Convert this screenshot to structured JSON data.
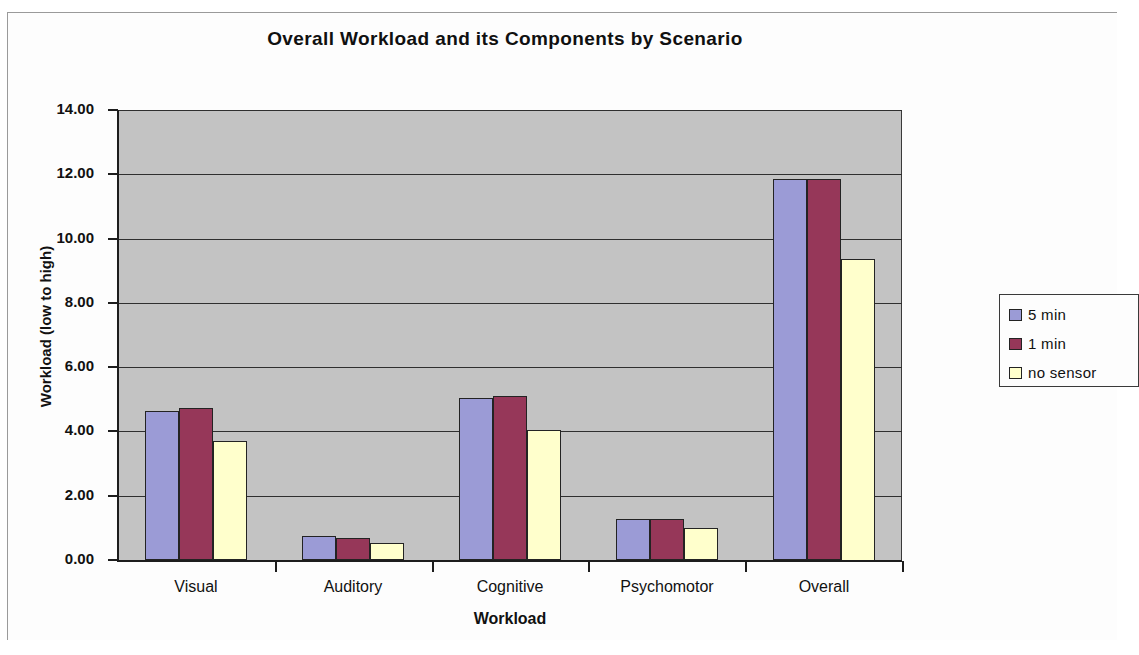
{
  "chart_data": {
    "type": "bar",
    "title": "Overall Workload and its Components by Scenario",
    "xlabel": "Workload",
    "ylabel": "Workload (low to high)",
    "categories": [
      "Visual",
      "Auditory",
      "Cognitive",
      "Psychomotor",
      "Overall"
    ],
    "series": [
      {
        "name": "5 min",
        "color": "#9b9bd6",
        "values": [
          4.65,
          0.75,
          5.05,
          1.28,
          11.85
        ]
      },
      {
        "name": "1 min",
        "color": "#963759",
        "values": [
          4.72,
          0.68,
          5.1,
          1.28,
          11.85
        ]
      },
      {
        "name": "no sensor",
        "color": "#ffffcc",
        "values": [
          3.7,
          0.53,
          4.05,
          1.0,
          9.38
        ]
      }
    ],
    "ylim": [
      0,
      14
    ],
    "ytick_step": 2,
    "ytick_labels": [
      "14.00",
      "12.00",
      "10.00",
      "8.00",
      "6.00",
      "4.00",
      "2.00",
      "0.00"
    ],
    "grid": true,
    "legend_position": "right",
    "plot_background": "#c3c3c3"
  },
  "legend": {
    "entries": [
      {
        "label": "5 min"
      },
      {
        "label": "1 min"
      },
      {
        "label": "no sensor"
      }
    ]
  }
}
